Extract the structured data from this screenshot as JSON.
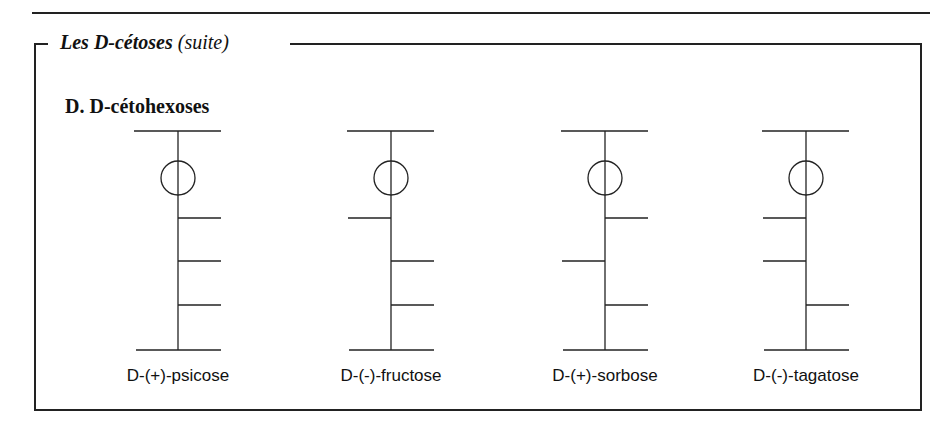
{
  "header": {
    "title_main": "Les D-cétoses",
    "title_suffix": "(suite)"
  },
  "section": {
    "title": "D. D-cétohexoses"
  },
  "molecules": [
    {
      "name": "D-(+)-psicose",
      "x": 178,
      "oh_sides": [
        "right",
        "right",
        "right"
      ]
    },
    {
      "name": "D-(-)-fructose",
      "x": 391,
      "oh_sides": [
        "left",
        "right",
        "right"
      ]
    },
    {
      "name": "D-(+)-sorbose",
      "x": 605,
      "oh_sides": [
        "right",
        "left",
        "right"
      ]
    },
    {
      "name": "D-(-)-tagatose",
      "x": 806,
      "oh_sides": [
        "left",
        "left",
        "right"
      ]
    }
  ],
  "colors": {
    "line": "#222222",
    "background": "#ffffff"
  }
}
